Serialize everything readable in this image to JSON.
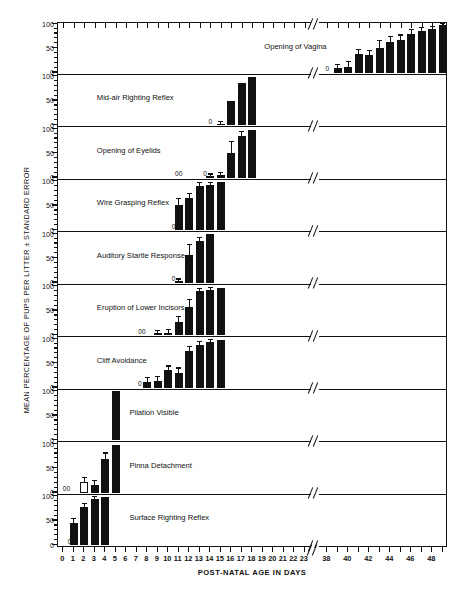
{
  "figure": {
    "ylabel": "MEAN PERCENTAGE OF PUPS PER LITTER ± STANDARD ERROR",
    "xlabel": "POST-NATAL AGE IN DAYS"
  },
  "chart_data": {
    "type": "bar",
    "title": "",
    "xlabel": "POST-NATAL AGE IN DAYS",
    "ylabel": "MEAN PERCENTAGE OF PUPS PER LITTER ± STANDARD ERROR",
    "ylim": [
      0,
      100
    ],
    "yticks": [
      0,
      50,
      100
    ],
    "ytick_labels": [
      "0",
      "50",
      "100"
    ],
    "grid": false,
    "legend": "none",
    "axis_break": {
      "after": 23,
      "before": 38
    },
    "x_segment_1": [
      0,
      1,
      2,
      3,
      4,
      5,
      6,
      7,
      8,
      9,
      10,
      11,
      12,
      13,
      14,
      15,
      16,
      17,
      18,
      19,
      20,
      21,
      22,
      23
    ],
    "x_segment_2": [
      38,
      39,
      40,
      41,
      42,
      43,
      44,
      45,
      46,
      47,
      48
    ],
    "xtick_labels_shown": [
      "0",
      "1",
      "2",
      "3",
      "4",
      "5",
      "6",
      "7",
      "8",
      "9",
      "10",
      "11",
      "12",
      "13",
      "14",
      "15",
      "16",
      "17",
      "18",
      "19",
      "20",
      "21",
      "22",
      "23",
      "38",
      "40",
      "42",
      "44",
      "46",
      "48"
    ],
    "panels": [
      {
        "label": "Opening of Vagina",
        "caption_x_day": 32.0,
        "zero_markers": [
          {
            "day": 38,
            "text": "0"
          }
        ],
        "bars": [
          {
            "day": 39,
            "value": 9,
            "err": 6
          },
          {
            "day": 40,
            "value": 12,
            "err": 9
          },
          {
            "day": 41,
            "value": 37,
            "err": 10
          },
          {
            "day": 42,
            "value": 36,
            "err": 9
          },
          {
            "day": 43,
            "value": 51,
            "err": 13
          },
          {
            "day": 44,
            "value": 63,
            "err": 10
          },
          {
            "day": 45,
            "value": 67,
            "err": 9
          },
          {
            "day": 46,
            "value": 80,
            "err": 7
          },
          {
            "day": 47,
            "value": 85,
            "err": 6
          },
          {
            "day": 48,
            "value": 90,
            "err": 4
          },
          {
            "day": 49,
            "value": 98,
            "err": 2
          }
        ]
      },
      {
        "label": "Mid-air Righting Reflex",
        "caption_x_day": 3.2,
        "zero_markers": [
          {
            "day": 14,
            "text": "0"
          }
        ],
        "bars": [
          {
            "day": 15,
            "value": 3,
            "err": 3
          },
          {
            "day": 16,
            "value": 49,
            "err": 0
          },
          {
            "day": 17,
            "value": 87,
            "err": 0
          },
          {
            "day": 18,
            "value": 99,
            "err": 0
          }
        ]
      },
      {
        "label": "Opening of Eyelids",
        "caption_x_day": 3.2,
        "zero_markers": [
          {
            "day": 11,
            "text": "00"
          },
          {
            "day": 13.5,
            "text": "0"
          }
        ],
        "bars": [
          {
            "day": 14,
            "value": 3,
            "err": 3
          },
          {
            "day": 15,
            "value": 5,
            "err": 5
          },
          {
            "day": 16,
            "value": 50,
            "err": 22
          },
          {
            "day": 17,
            "value": 86,
            "err": 7
          },
          {
            "day": 18,
            "value": 98,
            "err": 0
          }
        ]
      },
      {
        "label": "Wire Grasping Reflex",
        "caption_x_day": 3.2,
        "zero_markers": [
          {
            "day": 10.5,
            "text": "0"
          }
        ],
        "bars": [
          {
            "day": 11,
            "value": 52,
            "err": 11
          },
          {
            "day": 12,
            "value": 66,
            "err": 8
          },
          {
            "day": 13,
            "value": 91,
            "err": 5
          },
          {
            "day": 14,
            "value": 93,
            "err": 4
          },
          {
            "day": 15,
            "value": 99,
            "err": 0
          }
        ]
      },
      {
        "label": "Auditory Startle Response",
        "caption_x_day": 3.2,
        "zero_markers": [
          {
            "day": 10.5,
            "text": "0"
          }
        ],
        "bars": [
          {
            "day": 11,
            "value": 3,
            "err": 3
          },
          {
            "day": 12,
            "value": 57,
            "err": 20
          },
          {
            "day": 13,
            "value": 86,
            "err": 6
          },
          {
            "day": 14,
            "value": 99,
            "err": 0
          }
        ]
      },
      {
        "label": "Eruption of Lower Incisors",
        "caption_x_day": 3.2,
        "zero_markers": [
          {
            "day": 7.5,
            "text": "00"
          }
        ],
        "bars": [
          {
            "day": 9,
            "value": 4,
            "err": 4
          },
          {
            "day": 10,
            "value": 5,
            "err": 5
          },
          {
            "day": 11,
            "value": 27,
            "err": 10
          },
          {
            "day": 12,
            "value": 57,
            "err": 14
          },
          {
            "day": 13,
            "value": 91,
            "err": 4
          },
          {
            "day": 14,
            "value": 92,
            "err": 5
          },
          {
            "day": 15,
            "value": 97,
            "err": 0
          }
        ]
      },
      {
        "label": "Cliff Avoidance",
        "caption_x_day": 3.2,
        "zero_markers": [
          {
            "day": 7.3,
            "text": "0"
          }
        ],
        "bars": [
          {
            "day": 8,
            "value": 11,
            "err": 8
          },
          {
            "day": 9,
            "value": 13,
            "err": 8
          },
          {
            "day": 10,
            "value": 35,
            "err": 8
          },
          {
            "day": 11,
            "value": 30,
            "err": 9
          },
          {
            "day": 12,
            "value": 76,
            "err": 7
          },
          {
            "day": 13,
            "value": 88,
            "err": 5
          },
          {
            "day": 14,
            "value": 93,
            "err": 4
          },
          {
            "day": 15,
            "value": 97,
            "err": 0
          }
        ]
      },
      {
        "label": "Pilation Visible",
        "caption_x_day": 6.3,
        "zero_markers": [],
        "bars": [
          {
            "day": 5,
            "value": 100,
            "err": 0
          }
        ]
      },
      {
        "label": "Pinna Detachment",
        "caption_x_day": 6.3,
        "zero_markers": [
          {
            "day": 0.3,
            "text": "00"
          }
        ],
        "bars": [
          {
            "day": 2,
            "value": 21,
            "err": 8,
            "hollow": true
          },
          {
            "day": 3,
            "value": 16,
            "err": 8
          },
          {
            "day": 4,
            "value": 68,
            "err": 12
          },
          {
            "day": 5,
            "value": 97,
            "err": 0
          }
        ]
      },
      {
        "label": "Surface Righting Reflex",
        "caption_x_day": 6.3,
        "zero_markers": [
          {
            "day": 0.6,
            "text": "0"
          }
        ],
        "bars": [
          {
            "day": 1,
            "value": 46,
            "err": 8
          },
          {
            "day": 2,
            "value": 79,
            "err": 6
          },
          {
            "day": 3,
            "value": 94,
            "err": 4
          },
          {
            "day": 4,
            "value": 98,
            "err": 0
          }
        ]
      }
    ]
  }
}
